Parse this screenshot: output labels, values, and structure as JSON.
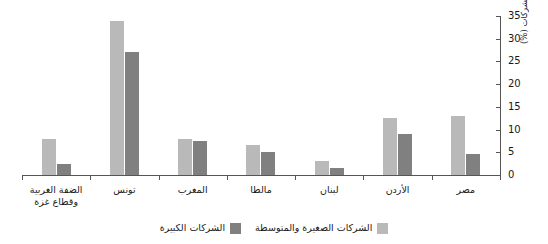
{
  "chart_data": {
    "type": "bar",
    "title": "",
    "subtitle": "",
    "xlabel": "",
    "ylabel": "نسبة جميع الشركات (%)",
    "ylim": [
      0,
      35
    ],
    "yticks": [
      0,
      5,
      10,
      15,
      20,
      25,
      30,
      35
    ],
    "grid": false,
    "legend_position": "bottom",
    "orientation": "rtl",
    "categories": [
      "الضفة الغربية وقطاع غزة",
      "تونس",
      "المغرب",
      "مالطا",
      "لبنان",
      "الأردن",
      "مصر"
    ],
    "series": [
      {
        "name": "الشركات الصغيرة والمتوسطة",
        "color": "#b9b9b9",
        "values": [
          8.0,
          34.0,
          8.0,
          6.5,
          3.0,
          12.5,
          13.0
        ]
      },
      {
        "name": "الشركات الكبيرة",
        "color": "#808080",
        "values": [
          2.5,
          27.0,
          7.5,
          5.0,
          1.5,
          9.0,
          4.7
        ]
      }
    ]
  },
  "axis": {
    "tick_labels": [
      "0",
      "5",
      "10",
      "15",
      "20",
      "25",
      "30",
      "35"
    ]
  },
  "category_labels": [
    {
      "line1": "الضفة الغربية",
      "line2": "وقطاع غزة"
    },
    {
      "line1": "تونس",
      "line2": ""
    },
    {
      "line1": "المغرب",
      "line2": ""
    },
    {
      "line1": "مالطا",
      "line2": ""
    },
    {
      "line1": "لبنان",
      "line2": ""
    },
    {
      "line1": "الأردن",
      "line2": ""
    },
    {
      "line1": "مصر",
      "line2": ""
    }
  ],
  "legend": {
    "items": [
      {
        "label": "الشركات الصغيرة والمتوسطة",
        "color": "#b9b9b9"
      },
      {
        "label": "الشركات الكبيرة",
        "color": "#808080"
      }
    ]
  }
}
